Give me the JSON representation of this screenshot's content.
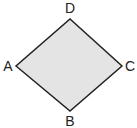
{
  "diagram": {
    "type": "rhombus",
    "fill": "#e4e4e4",
    "stroke": "#222222",
    "vertices": [
      {
        "label": "A",
        "x": 16,
        "y": 66
      },
      {
        "label": "B",
        "x": 70,
        "y": 111
      },
      {
        "label": "C",
        "x": 122,
        "y": 66
      },
      {
        "label": "D",
        "x": 70,
        "y": 19
      }
    ],
    "labels": {
      "A": "A",
      "B": "B",
      "C": "C",
      "D": "D"
    }
  }
}
